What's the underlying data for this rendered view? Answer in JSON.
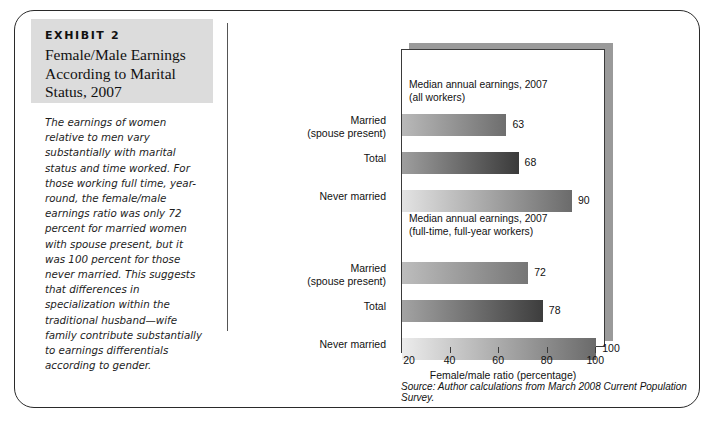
{
  "exhibit": {
    "label": "EXHIBIT 2",
    "title": "Female/Male Earnings According to Marital Status, 2007",
    "body": "The earnings of women relative to men vary substantially with marital status and time worked. For those working full time, year-round, the female/male earnings ratio was only 72 percent for married women with spouse present, but it was 100 percent for those never married. This suggests that differences in specialization within the traditional husband—wife family contribute substantially to earnings differentials according to gender."
  },
  "source": "Source: Author calculations from March 2008 Current Population Survey.",
  "chart_data": {
    "type": "bar",
    "orientation": "horizontal",
    "title": "",
    "xlabel": "Female/male ratio (percentage)",
    "ylabel": "",
    "xlim": [
      20,
      104
    ],
    "xticks": [
      20,
      40,
      60,
      80,
      100
    ],
    "xtick_labels": [
      "20",
      "40",
      "60",
      "80",
      "100"
    ],
    "grid": false,
    "legend": "none",
    "groups": [
      {
        "title": "Median annual earnings, 2007\n(all workers)",
        "categories": [
          "Married\n(spouse present)",
          "Total",
          "Never married"
        ],
        "values": [
          63,
          68,
          90
        ],
        "value_labels": [
          "63",
          "68",
          "90"
        ]
      },
      {
        "title": "Median annual earnings, 2007\n(full-time, full-year workers)",
        "categories": [
          "Married\n(spouse present)",
          "Total",
          "Never married"
        ],
        "values": [
          72,
          78,
          100
        ],
        "value_labels": [
          "72",
          "78",
          "100"
        ]
      }
    ],
    "bar_gradients": [
      {
        "from": "#b9b9b9",
        "to": "#6e6e6e"
      },
      {
        "from": "#9e9e9e",
        "to": "#3a3a3a"
      },
      {
        "from": "#e3e3e3",
        "to": "#6b6b6b"
      },
      {
        "from": "#bdbdbd",
        "to": "#767676"
      },
      {
        "from": "#a3a3a3",
        "to": "#3d3d3d"
      },
      {
        "from": "#ececec",
        "to": "#6a6a6a"
      }
    ]
  },
  "colors": {
    "band": "#dcdcdc",
    "border": "#2a2a2a",
    "shadow": "#9a9a9a"
  }
}
